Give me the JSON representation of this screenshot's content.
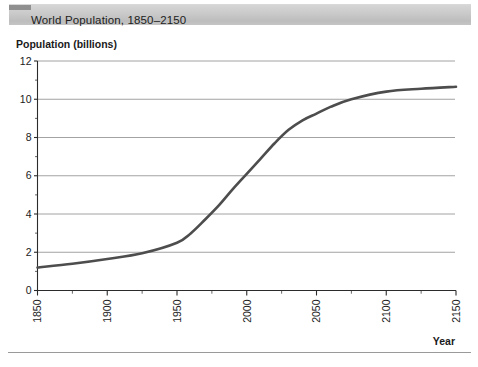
{
  "title_bar": {
    "title": "World Population, 1850–2150",
    "background_color": "#c9c9c9",
    "corner_color": "#8f8f8f"
  },
  "axis_titles": {
    "y": "Population (billions)",
    "x": "Year"
  },
  "chart_data": {
    "type": "line",
    "title": "World Population, 1850–2150",
    "xlabel": "Year",
    "ylabel": "Population (billions)",
    "xlim": [
      1850,
      2150
    ],
    "ylim": [
      0,
      12
    ],
    "grid": "horizontal",
    "legend": "none",
    "line_color": "#4d4d4d",
    "x_ticks": [
      1850,
      1900,
      1950,
      2000,
      2050,
      2100,
      2150
    ],
    "x_tick_labels": [
      "1850",
      "1900",
      "1950",
      "2000",
      "2050",
      "2100",
      "2150"
    ],
    "x_tick_label_rotation": -90,
    "x_minor_tick_interval": 25,
    "y_ticks": [
      0,
      2,
      4,
      6,
      8,
      10,
      12
    ],
    "y_tick_labels": [
      "0",
      "2",
      "4",
      "6",
      "8",
      "10",
      "12"
    ],
    "y_minor_ticks": [
      1,
      3,
      5,
      7,
      9,
      11
    ],
    "series": [
      {
        "name": "World population",
        "x": [
          1850,
          1875,
          1900,
          1925,
          1950,
          1960,
          1970,
          1980,
          1990,
          2000,
          2010,
          2020,
          2030,
          2040,
          2050,
          2060,
          2075,
          2100,
          2125,
          2150
        ],
        "values": [
          1.2,
          1.4,
          1.65,
          1.95,
          2.5,
          3.0,
          3.7,
          4.45,
          5.3,
          6.1,
          6.9,
          7.7,
          8.4,
          8.9,
          9.25,
          9.6,
          10.0,
          10.4,
          10.55,
          10.65
        ]
      }
    ]
  },
  "footer": {
    "rule_color": "#9a9a9a"
  }
}
